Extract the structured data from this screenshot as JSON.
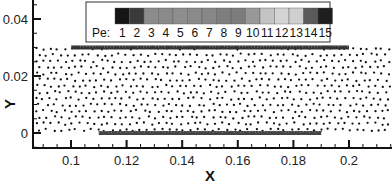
{
  "chart_data": {
    "type": "scatter",
    "title": "",
    "xlabel": "X",
    "ylabel": "Y",
    "xlim": [
      0.086,
      0.2155
    ],
    "ylim": [
      -0.0055,
      0.0467
    ],
    "x_ticks": [
      0.1,
      0.12,
      0.14,
      0.16,
      0.18,
      0.2
    ],
    "x_tick_labels": [
      "0.1",
      "0.12",
      "0.14",
      "0.16",
      "0.18",
      "0.2"
    ],
    "y_ticks": [
      0,
      0.02,
      0.04
    ],
    "y_tick_labels": [
      "0",
      "0.02",
      "0.04"
    ],
    "minor_tick_step": 0.005,
    "grid": false,
    "point_cloud": {
      "description": "Scattered particle points filling the domain",
      "x_range": [
        0.087,
        0.215
      ],
      "y_range": [
        0.0,
        0.03
      ],
      "marker": "dot",
      "color": "#111111"
    },
    "lines": [
      {
        "name": "top-boundary-line",
        "x": [
          0.1,
          0.2
        ],
        "y": [
          0.03,
          0.03
        ],
        "color": "#333333",
        "dense": true
      },
      {
        "name": "bottom-plate-line",
        "x": [
          0.11,
          0.19
        ],
        "y": [
          0.0,
          0.0
        ],
        "color": "#444444",
        "dense": true
      }
    ],
    "legend": {
      "title": "Pe:",
      "position": "top-center",
      "entries": [
        "1",
        "2",
        "3",
        "4",
        "5",
        "6",
        "7",
        "8",
        "9",
        "10",
        "11",
        "12",
        "13",
        "14",
        "15"
      ],
      "colors": [
        "#151515",
        "#3a3a3a",
        "#8c8c8c",
        "#8a8a8a",
        "#8e8e8e",
        "#8a8a8a",
        "#878787",
        "#7e7e7e",
        "#7c7c7c",
        "#999999",
        "#c4c4c4",
        "#d4d4d4",
        "#cfcfcf",
        "#5a5a5a",
        "#1e1e1e"
      ]
    }
  }
}
